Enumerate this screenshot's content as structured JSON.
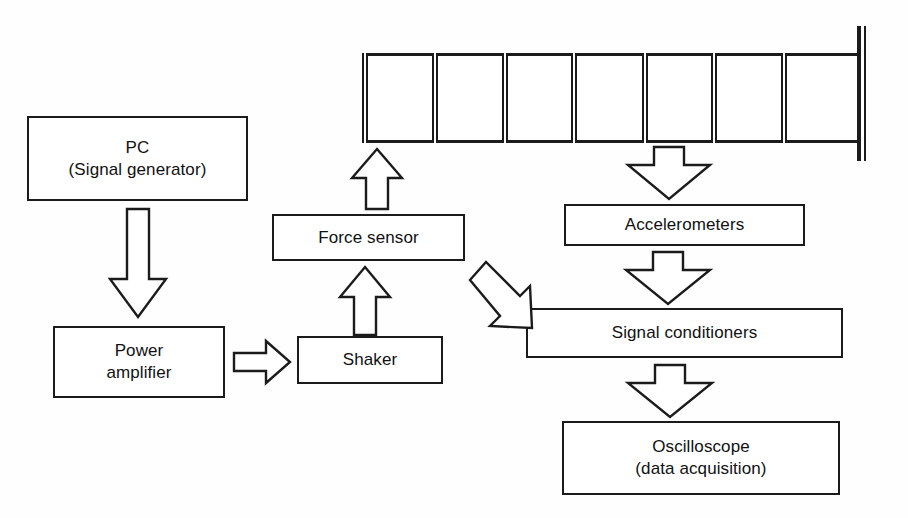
{
  "diagram": {
    "stroke_color": "#1b1b1b",
    "background_color": "#ffffff",
    "boxes": {
      "pc": {
        "line1": "PC",
        "line2": "(Signal generator)"
      },
      "power_amplifier": {
        "line1": "Power",
        "line2": "amplifier"
      },
      "shaker": {
        "line1": "Shaker"
      },
      "force_sensor": {
        "line1": "Force sensor"
      },
      "accelerometers": {
        "line1": "Accelerometers"
      },
      "signal_conditioners": {
        "line1": "Signal conditioners"
      },
      "oscilloscope": {
        "line1": "Oscilloscope",
        "line2": "(data acquisition)"
      }
    },
    "beam": {
      "name": "cantilever-beam",
      "cell_count": 7,
      "support_side": "right",
      "support_type": "fixed-clamped"
    },
    "arrows": [
      {
        "name": "pc-to-power-amplifier",
        "direction": "down"
      },
      {
        "name": "power-amplifier-to-shaker",
        "direction": "right"
      },
      {
        "name": "shaker-to-force-sensor",
        "direction": "up"
      },
      {
        "name": "force-sensor-to-beam",
        "direction": "up"
      },
      {
        "name": "beam-to-accelerometers",
        "direction": "down"
      },
      {
        "name": "accelerometers-to-signal-conditioners",
        "direction": "down"
      },
      {
        "name": "signal-conditioners-to-oscilloscope",
        "direction": "down"
      },
      {
        "name": "force-sensor-to-signal-conditioners",
        "direction": "down-right"
      }
    ]
  }
}
